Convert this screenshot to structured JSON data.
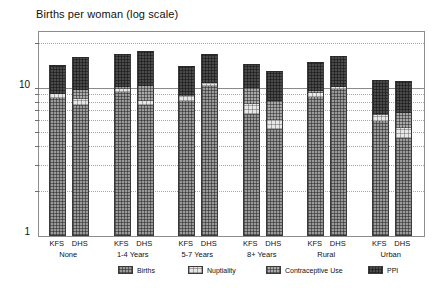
{
  "chart": {
    "title": "Births per woman (log scale)",
    "y_axis": {
      "scale": "log",
      "labels": [
        "10",
        "1"
      ],
      "min": 1,
      "max": 25
    },
    "legend": [
      {
        "label": "Births",
        "fill": "fill-births",
        "color": "#9a9a9a"
      },
      {
        "label": "Nuptiality",
        "fill": "fill-nuptiality",
        "color": "#e6e6e6"
      },
      {
        "label": "Contraceptive Use",
        "fill": "fill-contraceptive",
        "color": "#a9a9a9"
      },
      {
        "label": "PPI",
        "fill": "fill-ppi",
        "color": "#4a4a4a"
      }
    ]
  },
  "chart_data": {
    "type": "bar",
    "title": "Births per woman (log scale)",
    "xlabel": "",
    "ylabel": "Births per woman (log scale)",
    "yscale": "log",
    "ylim": [
      1,
      25
    ],
    "yticks": [
      1,
      10
    ],
    "ytick_labels": [
      "1",
      "10"
    ],
    "grid": true,
    "grid_style": "dotted minor, solid at 10",
    "legend_position": "bottom",
    "stacked": true,
    "groups": [
      "None",
      "1-4 Years",
      "5-7 Years",
      "8+ Years",
      "Rural",
      "Urban"
    ],
    "subcategories": [
      "KFS",
      "DHS"
    ],
    "series": [
      {
        "name": "Births",
        "values": [
          8.6,
          7.8,
          9.5,
          7.8,
          8.3,
          10.5,
          6.7,
          5.3,
          8.8,
          9.9,
          6.0,
          4.6
        ]
      },
      {
        "name": "Nuptiality",
        "values": [
          9.2,
          8.5,
          9.9,
          8.3,
          8.9,
          10.9,
          7.9,
          6.1,
          9.3,
          10.3,
          6.6,
          5.4
        ]
      },
      {
        "name": "Contraceptive Use",
        "values": [
          9.2,
          9.8,
          10.2,
          10.4,
          9.0,
          11.0,
          10.1,
          8.3,
          9.6,
          10.3,
          6.7,
          6.8
        ]
      },
      {
        "name": "PPI",
        "values": [
          14.5,
          16.5,
          17.2,
          18.0,
          14.2,
          17.1,
          14.6,
          13.2,
          15.2,
          16.6,
          11.4,
          11.2
        ]
      }
    ],
    "bars": [
      {
        "group": "None",
        "sub": "KFS",
        "births": 8.6,
        "nuptiality": 9.2,
        "contraceptive_use": 9.2,
        "ppi": 14.5
      },
      {
        "group": "None",
        "sub": "DHS",
        "births": 7.8,
        "nuptiality": 8.5,
        "contraceptive_use": 9.8,
        "ppi": 16.5
      },
      {
        "group": "1-4 Years",
        "sub": "KFS",
        "births": 9.5,
        "nuptiality": 9.9,
        "contraceptive_use": 10.2,
        "ppi": 17.2
      },
      {
        "group": "1-4 Years",
        "sub": "DHS",
        "births": 7.8,
        "nuptiality": 8.3,
        "contraceptive_use": 10.4,
        "ppi": 18.0
      },
      {
        "group": "5-7 Years",
        "sub": "KFS",
        "births": 8.3,
        "nuptiality": 8.9,
        "contraceptive_use": 9.0,
        "ppi": 14.2
      },
      {
        "group": "5-7 Years",
        "sub": "DHS",
        "births": 10.5,
        "nuptiality": 10.9,
        "contraceptive_use": 11.0,
        "ppi": 17.1
      },
      {
        "group": "8+ Years",
        "sub": "KFS",
        "births": 6.7,
        "nuptiality": 7.9,
        "contraceptive_use": 10.1,
        "ppi": 14.6
      },
      {
        "group": "8+ Years",
        "sub": "DHS",
        "births": 5.3,
        "nuptiality": 6.1,
        "contraceptive_use": 8.3,
        "ppi": 13.2
      },
      {
        "group": "Rural",
        "sub": "KFS",
        "births": 8.8,
        "nuptiality": 9.3,
        "contraceptive_use": 9.6,
        "ppi": 15.2
      },
      {
        "group": "Rural",
        "sub": "DHS",
        "births": 9.9,
        "nuptiality": 10.3,
        "contraceptive_use": 10.3,
        "ppi": 16.6
      },
      {
        "group": "Urban",
        "sub": "KFS",
        "births": 6.0,
        "nuptiality": 6.6,
        "contraceptive_use": 6.7,
        "ppi": 11.4
      },
      {
        "group": "Urban",
        "sub": "DHS",
        "births": 4.6,
        "nuptiality": 5.4,
        "contraceptive_use": 6.8,
        "ppi": 11.2
      }
    ],
    "gridline_values": [
      2,
      3,
      4,
      5,
      6,
      7,
      8,
      9,
      10,
      20
    ],
    "legend_entries": [
      "Births",
      "Nuptiality",
      "Contraceptive Use",
      "PPI"
    ]
  }
}
